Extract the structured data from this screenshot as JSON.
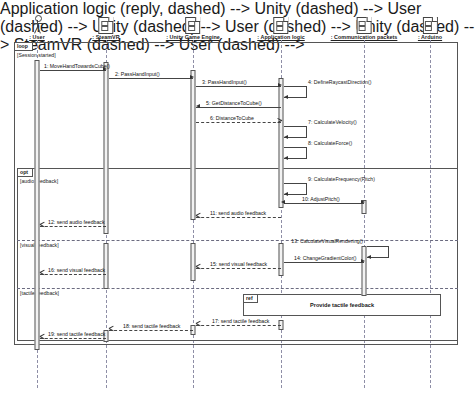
{
  "diagram": {
    "type": "UML sequence diagram",
    "lifelines": [
      {
        "id": "user",
        "label": ": User",
        "icon": "actor-stick-figure",
        "x": 37
      },
      {
        "id": "steamvr",
        "label": ": SteamVR",
        "icon": "object-node-icon",
        "x": 106
      },
      {
        "id": "unity",
        "label": ": Unity Game Engine",
        "icon": "object-node-icon",
        "x": 193
      },
      {
        "id": "applogic",
        "label": ": Application logic",
        "icon": "object-node-icon",
        "x": 281
      },
      {
        "id": "packets",
        "label": ": Communication packets",
        "icon": "object-node-icon",
        "x": 364
      },
      {
        "id": "arduino",
        "label": ": Arduino",
        "icon": "object-node-icon",
        "x": 430
      }
    ],
    "fragments": [
      {
        "id": "loop",
        "operator": "loop",
        "guard": "[Session started]"
      },
      {
        "id": "opt",
        "operator": "opt",
        "guard": "[audio feedback]"
      },
      {
        "id": "visual",
        "operator": "",
        "guard": "[visual feedback]"
      },
      {
        "id": "tactile",
        "operator": "",
        "guard": "[tactile feedback]"
      },
      {
        "id": "ref",
        "operator": "ref",
        "guard": "Provide tactile feedback"
      }
    ],
    "messages": [
      {
        "n": "1",
        "label": "1: MoveHandTowardsCube()",
        "from": "user",
        "to": "steamvr",
        "kind": "sync"
      },
      {
        "n": "2",
        "label": "2: PassHandInput()",
        "from": "steamvr",
        "to": "unity",
        "kind": "sync"
      },
      {
        "n": "3",
        "label": "3: PassHandInput()",
        "from": "unity",
        "to": "applogic",
        "kind": "sync"
      },
      {
        "n": "4",
        "label": "4: DefineRaycastDirection()",
        "from": "applogic",
        "to": "applogic",
        "kind": "self"
      },
      {
        "n": "5",
        "label": "5: GetDistanceToCube()",
        "from": "applogic",
        "to": "unity",
        "kind": "sync"
      },
      {
        "n": "6",
        "label": "6: DistanceToCube",
        "from": "unity",
        "to": "applogic",
        "kind": "reply"
      },
      {
        "n": "7",
        "label": "7: CalculateVelocity()",
        "from": "applogic",
        "to": "applogic",
        "kind": "self"
      },
      {
        "n": "8",
        "label": "8: CalculateForce()",
        "from": "applogic",
        "to": "applogic",
        "kind": "self"
      },
      {
        "n": "9",
        "label": "9: CalculateFrequency(Pitch)",
        "from": "applogic",
        "to": "applogic",
        "kind": "self"
      },
      {
        "n": "10",
        "label": "10: AdjustPitch()",
        "from": "applogic",
        "to": "packets",
        "kind": "sync"
      },
      {
        "n": "11",
        "label": "11: send audio feedback",
        "from": "applogic",
        "to": "unity",
        "kind": "reply"
      },
      {
        "n": "12",
        "label": "12: send audio feedback",
        "from": "steamvr",
        "to": "user",
        "kind": "reply"
      },
      {
        "n": "13",
        "label": "13: CalculateVisualRendering()",
        "from": "packets",
        "to": "packets",
        "kind": "self"
      },
      {
        "n": "14",
        "label": "14: ChangeGradientColor()",
        "from": "applogic",
        "to": "packets",
        "kind": "sync"
      },
      {
        "n": "15",
        "label": "15: send visual feedback",
        "from": "applogic",
        "to": "unity",
        "kind": "reply"
      },
      {
        "n": "16",
        "label": "16: send visual feedback",
        "from": "steamvr",
        "to": "user",
        "kind": "reply"
      },
      {
        "n": "17",
        "label": "17: send tactile feedback",
        "from": "applogic",
        "to": "unity",
        "kind": "reply"
      },
      {
        "n": "18",
        "label": "18: send tactile feedback",
        "from": "unity",
        "to": "steamvr",
        "kind": "reply"
      },
      {
        "n": "19",
        "label": "19: send tactile feedback",
        "from": "steamvr",
        "to": "user",
        "kind": "reply"
      }
    ]
  }
}
